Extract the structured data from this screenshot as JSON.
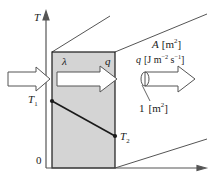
{
  "figure": {
    "kind": "thermal-conduction-diagram",
    "background_color": "#ffffff",
    "slab_fill_color": "#d4d4d4",
    "line_color": "#1a1a1a",
    "perspective_line_color": "#555555",
    "axes": {
      "vertical_axis_label": "T",
      "origin_label": "0",
      "horizontal_axis_label": ""
    },
    "labels": {
      "conductivity": "λ",
      "flux_in_slab": "q",
      "temp_hot": "T",
      "temp_hot_sub": "1",
      "temp_cold": "T",
      "temp_cold_sub": "2",
      "area_symbol": "A",
      "area_units_open": "[m",
      "area_units_sup": "2",
      "area_units_close": "]",
      "flux_symbol": "q",
      "flux_units_open": "[J m",
      "flux_units_sup1": "−2",
      "flux_units_mid": " s",
      "flux_units_sup2": "−1",
      "flux_units_close": "]",
      "unit_area_number": "1",
      "unit_area_open": "[m",
      "unit_area_sup": "2",
      "unit_area_close": "]"
    },
    "geometry": {
      "slab_left_x": 52,
      "slab_right_x": 115,
      "slab_top_y": 52,
      "slab_bottom_y": 168,
      "temp_hot_y": 101,
      "temp_cold_y": 136
    }
  }
}
